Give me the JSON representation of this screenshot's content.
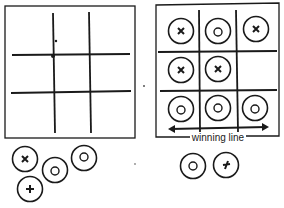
{
  "diagram": {
    "left_board": {
      "description": "empty 3x3 grid",
      "cells": [
        "",
        "",
        "",
        "",
        "",
        "",
        "",
        "",
        ""
      ]
    },
    "right_board": {
      "cells": [
        "X",
        "O",
        "X",
        "X",
        "X",
        "",
        "O",
        "O",
        "O"
      ],
      "annotation": "winning line"
    },
    "left_pieces": [
      "X",
      "O",
      "O",
      "+"
    ],
    "right_pieces": [
      "O",
      "+"
    ],
    "colors": {
      "ink": "#1a1a1a",
      "background": "#ffffff"
    }
  }
}
